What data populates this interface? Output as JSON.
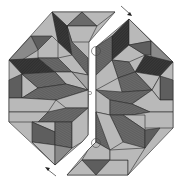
{
  "figure": {
    "colors": {
      "light": "#b9b9b9",
      "mid": "#8a8a8a",
      "dark": "#5c5c5c",
      "darkest": "#2e2e2e",
      "outline": "#2a2a2a",
      "background": "#ffffff"
    },
    "pieces": [
      {
        "name": "left-half"
      },
      {
        "name": "right-half"
      }
    ],
    "markers": {
      "hinge_circles": 3,
      "center_point": 1,
      "arrows": [
        {
          "name": "arrow-top-right",
          "direction": "down-right"
        },
        {
          "name": "arrow-bottom-left",
          "direction": "up-left"
        }
      ]
    }
  }
}
